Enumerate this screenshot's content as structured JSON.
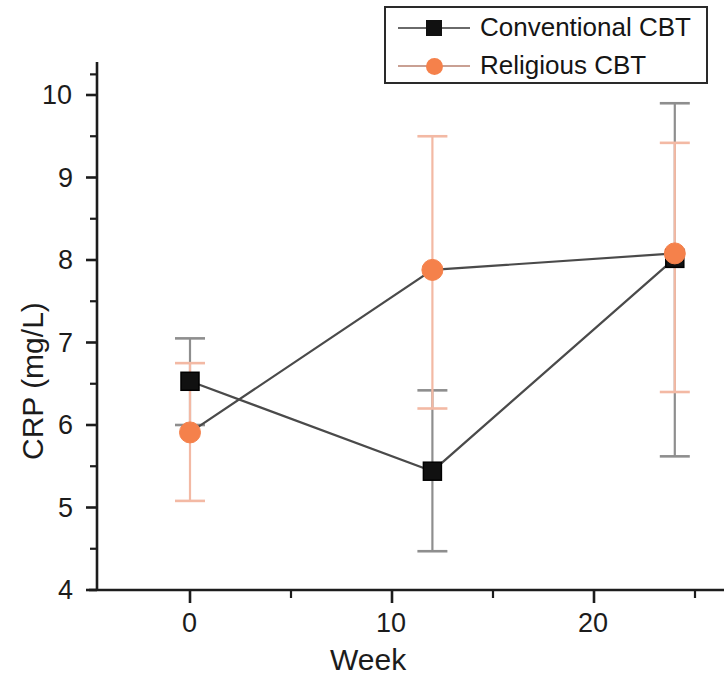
{
  "chart_data": {
    "type": "line",
    "title": "",
    "subtitle": "",
    "xlabel": "Week",
    "ylabel": "CRP (mg/L)",
    "x": [
      0,
      12,
      24
    ],
    "xlim": [
      -2.2,
      26.4
    ],
    "ylim": [
      4,
      10.45
    ],
    "xticks": [
      0,
      10,
      20
    ],
    "xtick_labels": [
      "0",
      "10",
      "20"
    ],
    "xminor_ticks": [
      5,
      15,
      25
    ],
    "yticks": [
      4,
      5,
      6,
      7,
      8,
      9,
      10
    ],
    "ytick_labels": [
      "4",
      "5",
      "6",
      "7",
      "8",
      "9",
      "10"
    ],
    "yminor_ticks": [
      4.5,
      5.5,
      6.5,
      7.5,
      8.5,
      9.5,
      10.25
    ],
    "grid": false,
    "legend_position": "top-right",
    "error_bar_type": "symmetric",
    "series": [
      {
        "name": "Conventional CBT",
        "color": "#111111",
        "marker": "square",
        "line_color": "#4a4a4a",
        "values": [
          6.53,
          5.44,
          8.02
        ],
        "err_low": [
          6.0,
          4.47,
          5.62
        ],
        "err_high": [
          7.05,
          6.42,
          9.9
        ]
      },
      {
        "name": "Religious CBT",
        "color": "#f5814b",
        "marker": "circle",
        "line_color": "#4a4a4a",
        "values": [
          5.91,
          7.88,
          8.08
        ],
        "err_low": [
          5.08,
          6.2,
          6.4
        ],
        "err_high": [
          6.75,
          9.5,
          9.42
        ]
      }
    ]
  },
  "axes": {
    "ylabel": "CRP (mg/L)",
    "xlabel": "Week",
    "ytick_labels": [
      "10",
      "9",
      "8",
      "7",
      "6",
      "5",
      "4"
    ],
    "xtick_labels": [
      "0",
      "10",
      "20"
    ]
  },
  "legend": {
    "items": [
      {
        "label": "Conventional CBT",
        "marker": "square-marker",
        "color": "#111111"
      },
      {
        "label": "Religious CBT",
        "marker": "circle-marker",
        "color": "#f5814b"
      }
    ]
  }
}
